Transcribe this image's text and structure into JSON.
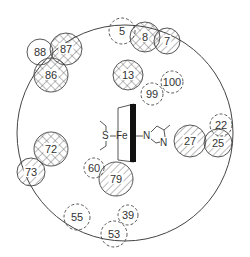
{
  "diagram": {
    "type": "heme-pocket-residue-map",
    "outer_circle": {
      "cx": 125,
      "cy": 133,
      "r": 108
    },
    "colors": {
      "stroke": "#444444",
      "text": "#333333",
      "background": "#ffffff",
      "heme_bar": "#111111"
    },
    "legend_styles": {
      "crosshatch": "solid circle with cross-hatch fill",
      "hatched": "solid circle with diagonal hatch fill",
      "dashed": "dashed circle, no fill",
      "open": "solid circle, no fill"
    },
    "residues": [
      {
        "label": "5",
        "cx": 122,
        "cy": 31,
        "r": 13,
        "style": "dashed"
      },
      {
        "label": "8",
        "cx": 145,
        "cy": 37,
        "r": 15,
        "style": "crosshatch"
      },
      {
        "label": "7",
        "cx": 167,
        "cy": 41,
        "r": 13,
        "style": "hatched"
      },
      {
        "label": "88",
        "cx": 40,
        "cy": 52,
        "r": 13,
        "style": "open"
      },
      {
        "label": "87",
        "cx": 66,
        "cy": 49,
        "r": 16,
        "style": "crosshatch"
      },
      {
        "label": "86",
        "cx": 51,
        "cy": 75,
        "r": 17,
        "style": "crosshatch"
      },
      {
        "label": "13",
        "cx": 128,
        "cy": 75,
        "r": 15,
        "style": "crosshatch"
      },
      {
        "label": "100",
        "cx": 172,
        "cy": 82,
        "r": 11,
        "style": "dashed"
      },
      {
        "label": "99",
        "cx": 152,
        "cy": 94,
        "r": 11,
        "style": "dashed"
      },
      {
        "label": "22",
        "cx": 221,
        "cy": 125,
        "r": 11,
        "style": "dashed"
      },
      {
        "label": "27",
        "cx": 190,
        "cy": 141,
        "r": 16,
        "style": "hatched"
      },
      {
        "label": "25",
        "cx": 218,
        "cy": 143,
        "r": 14,
        "style": "hatched"
      },
      {
        "label": "72",
        "cx": 51,
        "cy": 149,
        "r": 17,
        "style": "crosshatch"
      },
      {
        "label": "73",
        "cx": 31,
        "cy": 172,
        "r": 14,
        "style": "hatched"
      },
      {
        "label": "60",
        "cx": 94,
        "cy": 168,
        "r": 10,
        "style": "dashed"
      },
      {
        "label": "79",
        "cx": 116,
        "cy": 179,
        "r": 17,
        "style": "hatched"
      },
      {
        "label": "55",
        "cx": 77,
        "cy": 217,
        "r": 13,
        "style": "dashed"
      },
      {
        "label": "39",
        "cx": 128,
        "cy": 215,
        "r": 10,
        "style": "dashed"
      },
      {
        "label": "53",
        "cx": 114,
        "cy": 234,
        "r": 13,
        "style": "dashed"
      }
    ],
    "heme": {
      "iron_label": "Fe",
      "sulfur_label": "S",
      "imidazole_n1": "N",
      "imidazole_n2": "N"
    }
  }
}
